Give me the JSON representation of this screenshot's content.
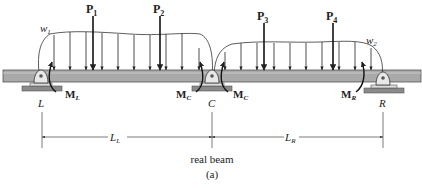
{
  "figure": {
    "caption": "real beam",
    "sublabel": "(a)",
    "colors": {
      "beam_fill": "#a9a9a9",
      "beam_edge": "#555555",
      "support_fill": "#8a8a8a",
      "line": "#222222",
      "background": "#ffffff"
    }
  },
  "supports": [
    {
      "id": "L",
      "label": "L",
      "x": 42
    },
    {
      "id": "C",
      "label": "C",
      "x": 212
    },
    {
      "id": "R",
      "label": "R",
      "x": 383
    }
  ],
  "point_loads": [
    {
      "id": "P1",
      "main": "P",
      "sub": "1",
      "x": 93
    },
    {
      "id": "P2",
      "main": "P",
      "sub": "2",
      "x": 160
    },
    {
      "id": "P3",
      "main": "P",
      "sub": "3",
      "x": 264
    },
    {
      "id": "P4",
      "main": "P",
      "sub": "4",
      "x": 333
    }
  ],
  "distributed_loads": [
    {
      "id": "w1",
      "main": "w",
      "sub": "1"
    },
    {
      "id": "w2",
      "main": "w",
      "sub": "2"
    }
  ],
  "moments": [
    {
      "id": "ML",
      "main": "M",
      "sub": "L"
    },
    {
      "id": "MC_left",
      "main": "M",
      "sub": "C"
    },
    {
      "id": "MC_right",
      "main": "M",
      "sub": "C"
    },
    {
      "id": "MR",
      "main": "M",
      "sub": "R"
    }
  ],
  "dimensions": [
    {
      "id": "LL",
      "main": "L",
      "sub": "L"
    },
    {
      "id": "LR",
      "main": "L",
      "sub": "R"
    }
  ]
}
